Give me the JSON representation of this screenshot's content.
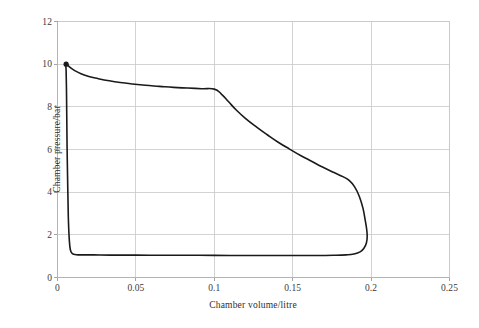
{
  "chart_data": {
    "type": "line",
    "title": "",
    "subtitle": "",
    "xlabel": "Chamber volume/litre",
    "ylabel": "Chamber pressure/bar",
    "xlim": [
      0,
      0.25
    ],
    "ylim": [
      0,
      12
    ],
    "xticks": [
      "0",
      "0.05",
      "0.1",
      "0.15",
      "0.2",
      "0.25"
    ],
    "xtick_values": [
      0,
      0.05,
      0.1,
      0.15,
      0.2,
      0.25
    ],
    "yticks": [
      "0",
      "2",
      "4",
      "6",
      "8",
      "10",
      "12"
    ],
    "ytick_values": [
      0,
      2,
      4,
      6,
      8,
      10,
      12
    ],
    "grid": "both",
    "grid_color": "#c8c8c8",
    "legend": "none",
    "line_color": "#1a1a1a",
    "line_width": 1.6,
    "marker": {
      "name": "start-point-marker",
      "x": 0.0055,
      "y": 10.0,
      "shape": "circle",
      "color": "#1a1a1a"
    },
    "series": [
      {
        "name": "Indicator diagram (closed P-V loop)",
        "closed": true,
        "points": [
          [
            0.0055,
            10.0
          ],
          [
            0.008,
            9.85
          ],
          [
            0.011,
            9.7
          ],
          [
            0.015,
            9.55
          ],
          [
            0.02,
            9.42
          ],
          [
            0.026,
            9.32
          ],
          [
            0.033,
            9.22
          ],
          [
            0.04,
            9.14
          ],
          [
            0.048,
            9.07
          ],
          [
            0.056,
            9.01
          ],
          [
            0.065,
            8.96
          ],
          [
            0.074,
            8.91
          ],
          [
            0.083,
            8.88
          ],
          [
            0.092,
            8.85
          ],
          [
            0.1,
            8.83
          ],
          [
            0.1045,
            8.6
          ],
          [
            0.109,
            8.25
          ],
          [
            0.114,
            7.85
          ],
          [
            0.12,
            7.45
          ],
          [
            0.127,
            7.05
          ],
          [
            0.134,
            6.68
          ],
          [
            0.141,
            6.33
          ],
          [
            0.148,
            6.02
          ],
          [
            0.155,
            5.72
          ],
          [
            0.162,
            5.45
          ],
          [
            0.169,
            5.18
          ],
          [
            0.176,
            4.93
          ],
          [
            0.182,
            4.73
          ],
          [
            0.186,
            4.55
          ],
          [
            0.1895,
            4.25
          ],
          [
            0.1925,
            3.8
          ],
          [
            0.1948,
            3.25
          ],
          [
            0.1962,
            2.7
          ],
          [
            0.1972,
            2.25
          ],
          [
            0.1975,
            1.9
          ],
          [
            0.197,
            1.62
          ],
          [
            0.1955,
            1.38
          ],
          [
            0.193,
            1.2
          ],
          [
            0.189,
            1.1
          ],
          [
            0.184,
            1.06
          ],
          [
            0.176,
            1.04
          ],
          [
            0.165,
            1.03
          ],
          [
            0.15,
            1.03
          ],
          [
            0.13,
            1.03
          ],
          [
            0.11,
            1.03
          ],
          [
            0.09,
            1.04
          ],
          [
            0.07,
            1.04
          ],
          [
            0.05,
            1.05
          ],
          [
            0.034,
            1.05
          ],
          [
            0.023,
            1.06
          ],
          [
            0.016,
            1.06
          ],
          [
            0.012,
            1.07
          ],
          [
            0.0095,
            1.12
          ],
          [
            0.0082,
            1.3
          ],
          [
            0.0075,
            1.8
          ],
          [
            0.007,
            2.6
          ],
          [
            0.0067,
            3.6
          ],
          [
            0.0064,
            4.8
          ],
          [
            0.0061,
            6.2
          ],
          [
            0.0059,
            7.6
          ],
          [
            0.0057,
            8.9
          ],
          [
            0.0055,
            9.7
          ],
          [
            0.0055,
            10.0
          ]
        ]
      }
    ]
  },
  "axes": {
    "frame_color": "#b4b4b4",
    "tick_color": "#9a9a9a"
  }
}
